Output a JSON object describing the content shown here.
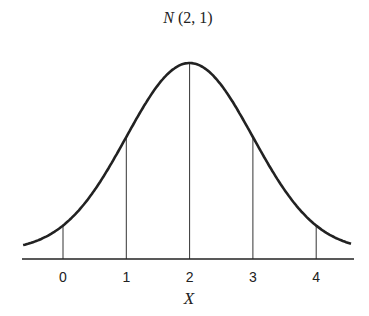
{
  "chart_data": {
    "type": "line",
    "title": "N (2, 1)",
    "title_parts": {
      "symbol": "N",
      "params": " (2, 1)"
    },
    "xlabel": "X",
    "ylabel": "",
    "distribution": {
      "name": "normal",
      "mean": 2,
      "variance": 1
    },
    "x_ticks": [
      "0",
      "1",
      "2",
      "3",
      "4"
    ],
    "xlim": [
      -0.7,
      4.6
    ],
    "vertical_lines_at": [
      0,
      1,
      2,
      3,
      4
    ],
    "grid": false,
    "legend": null,
    "color": "#222222"
  }
}
